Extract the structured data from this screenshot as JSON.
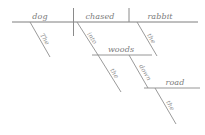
{
  "diagram": {
    "type": "reed-kellogg-sentence-diagram",
    "sentence": "The dog chased the rabbit into the woods down the road",
    "colors": {
      "background": "#ffffff",
      "line": "#8a8a8a",
      "text": "#7a7a7a",
      "modifier_text": "#8c8c8c"
    },
    "baselines": {
      "main_label": "main clause baseline",
      "prepositional_woods_label": "into the woods phrase baseline",
      "prepositional_road_label": "down the road phrase baseline"
    },
    "nodes": {
      "subject": "dog",
      "subject_article": "The",
      "verb": "chased",
      "object": "rabbit",
      "object_article": "the",
      "preposition_1": "into",
      "prep_object_1": "woods",
      "prep_object_1_article": "the",
      "preposition_2": "down",
      "prep_object_2": "road",
      "prep_object_2_article": "the"
    }
  }
}
